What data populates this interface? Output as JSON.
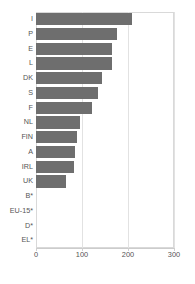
{
  "chart_data": {
    "type": "bar",
    "orientation": "horizontal",
    "title": "",
    "xlabel": "",
    "ylabel": "",
    "xlim": [
      0,
      300
    ],
    "ylim": null,
    "grid": true,
    "legend": null,
    "xticks": [
      "0",
      "100",
      "200",
      "300"
    ],
    "xtick_values": [
      0,
      100,
      200,
      300
    ],
    "categories": [
      "I",
      "P",
      "E",
      "L",
      "DK",
      "S",
      "F",
      "NL",
      "FIN",
      "A",
      "IRL",
      "UK",
      "B*",
      "EU-15*",
      "D*",
      "EL*"
    ],
    "values": [
      208,
      177,
      166,
      165,
      143,
      134,
      121,
      96,
      90,
      85,
      83,
      66,
      null,
      null,
      null,
      null
    ],
    "bar_color": "#6e6e6e",
    "grid_color": "#e2e2e2",
    "frame_color": "#d9d9d9",
    "tick_label_color": "#555555",
    "note": "Categories B*, EU-15*, D* and EL* have no bar drawn (no data)."
  }
}
